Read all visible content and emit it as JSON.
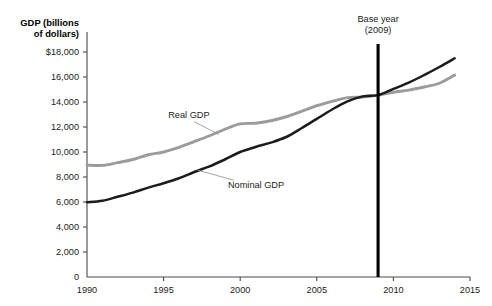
{
  "chart_data": {
    "type": "line",
    "title_line1": "GDP (billions",
    "title_line2": "of dollars)",
    "xlabel": "",
    "ylabel": "GDP (billions of dollars)",
    "xlim": [
      1990,
      2015
    ],
    "ylim": [
      0,
      18000
    ],
    "xticks": [
      1990,
      1995,
      2000,
      2005,
      2010,
      2015
    ],
    "xtick_labels": [
      "1990",
      "1995",
      "2000",
      "2005",
      "2010",
      "2015"
    ],
    "yticks": [
      0,
      2000,
      4000,
      6000,
      8000,
      10000,
      12000,
      14000,
      16000,
      18000
    ],
    "ytick_labels": [
      "0",
      "2,000",
      "4,000",
      "6,000",
      "8,000",
      "10,000",
      "12,000",
      "14,000",
      "16,000",
      "$18,000"
    ],
    "grid": false,
    "legend_position": "inline-labels",
    "annotations": [
      {
        "name": "base-year",
        "text_line1": "Base year",
        "text_line2": "(2009)",
        "x": 2009,
        "type": "vertical-line"
      }
    ],
    "series": [
      {
        "name": "Real GDP",
        "color": "#9b9b9b",
        "label_x": 1995.3,
        "label_y": 12750,
        "x": [
          1990,
          1991,
          1992,
          1993,
          1994,
          1995,
          1996,
          1997,
          1998,
          1999,
          2000,
          2001,
          2002,
          2003,
          2004,
          2005,
          2006,
          2007,
          2008,
          2009,
          2010,
          2011,
          2012,
          2013,
          2014
        ],
        "values": [
          8950,
          8930,
          9150,
          9400,
          9780,
          10000,
          10370,
          10830,
          11300,
          11820,
          12250,
          12300,
          12500,
          12820,
          13250,
          13700,
          14050,
          14350,
          14400,
          14550,
          14780,
          14950,
          15200,
          15500,
          16150
        ]
      },
      {
        "name": "Nominal GDP",
        "color": "#1b1b1b",
        "label_x": 1999.2,
        "label_y": 7100,
        "x": [
          1990,
          1991,
          1992,
          1993,
          1994,
          1995,
          1996,
          1997,
          1998,
          1999,
          2000,
          2001,
          2002,
          2003,
          2004,
          2005,
          2006,
          2007,
          2008,
          2009,
          2010,
          2011,
          2012,
          2013,
          2014
        ],
        "values": [
          5980,
          6100,
          6420,
          6750,
          7150,
          7500,
          7900,
          8400,
          8850,
          9400,
          10000,
          10400,
          10750,
          11200,
          11900,
          12650,
          13400,
          14050,
          14450,
          14550,
          15050,
          15550,
          16150,
          16800,
          17500
        ]
      }
    ]
  }
}
